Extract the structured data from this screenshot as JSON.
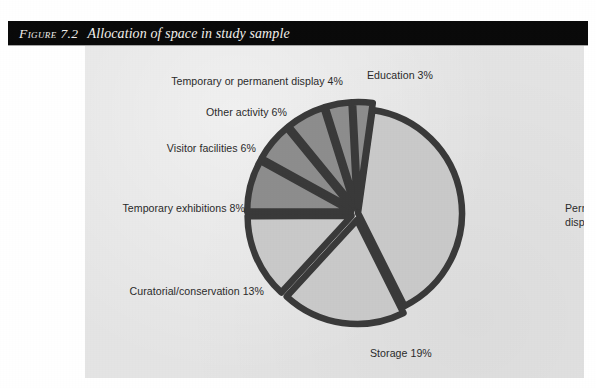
{
  "figure": {
    "number_label": "Figure 7.2",
    "title": "Allocation of space in study sample"
  },
  "colors": {
    "banner_background": "#0a0a0a",
    "banner_text": "#f2f0ec",
    "panel_background": "#e4e4e4",
    "page_background": "#ffffff",
    "slice_major": "#c9c9c9",
    "slice_minor": "#8d8d8d",
    "slice_outline": "#3a3a3a",
    "label_text": "#2b2b2b"
  },
  "chart_data": {
    "type": "pie",
    "title": "Allocation of space in study sample",
    "subtitle": "",
    "xlabel": "",
    "ylabel": "",
    "units": "percent",
    "total": 99,
    "legend_position": "none",
    "grid": false,
    "labels_outside": true,
    "categories": [
      "Permanent displays",
      "Storage",
      "Curatorial/conservation",
      "Temporary exhibitions",
      "Visitor facilities",
      "Other activity",
      "Temporary or permanent display",
      "Education"
    ],
    "values": [
      40,
      19,
      13,
      8,
      6,
      6,
      4,
      3
    ],
    "slices": [
      {
        "category": "Permanent displays",
        "value": 40,
        "label": "Permanent displays 40%",
        "label_lines": [
          "Permanent",
          "displays 40%"
        ],
        "fill": "#c9c9c9",
        "exploded": false,
        "label_x": 480,
        "label_y": 166,
        "label_anchor": "start"
      },
      {
        "category": "Storage",
        "value": 19,
        "label": "Storage 19%",
        "label_lines": [
          "Storage 19%"
        ],
        "fill": "#c9c9c9",
        "exploded": true,
        "label_x": 285,
        "label_y": 311,
        "label_anchor": "start"
      },
      {
        "category": "Curatorial/conservation",
        "value": 13,
        "label": "Curatorial/conservation 13%",
        "label_lines": [
          "Curatorial/conservation 13%"
        ],
        "fill": "#c9c9c9",
        "exploded": true,
        "label_x": 179,
        "label_y": 249,
        "label_anchor": "end"
      },
      {
        "category": "Temporary exhibitions",
        "value": 8,
        "label": "Temporary exhibitions 8%",
        "label_lines": [
          "Temporary exhibitions 8%"
        ],
        "fill": "#8d8d8d",
        "exploded": true,
        "label_x": 160,
        "label_y": 166,
        "label_anchor": "end"
      },
      {
        "category": "Visitor facilities",
        "value": 6,
        "label": "Visitor facilities 6%",
        "label_lines": [
          "Visitor facilities 6%"
        ],
        "fill": "#8d8d8d",
        "exploded": true,
        "label_x": 171,
        "label_y": 106,
        "label_anchor": "end"
      },
      {
        "category": "Other activity",
        "value": 6,
        "label": "Other activity 6%",
        "label_lines": [
          "Other activity 6%"
        ],
        "fill": "#8d8d8d",
        "exploded": true,
        "label_x": 202,
        "label_y": 70,
        "label_anchor": "end"
      },
      {
        "category": "Temporary or permanent display",
        "value": 4,
        "label": "Temporary or permanent display 4%",
        "label_lines": [
          "Temporary or permanent display 4%"
        ],
        "fill": "#8d8d8d",
        "exploded": true,
        "label_x": 258,
        "label_y": 39,
        "label_anchor": "end"
      },
      {
        "category": "Education",
        "value": 3,
        "label": "Education 3%",
        "label_lines": [
          "Education 3%"
        ],
        "fill": "#8d8d8d",
        "exploded": true,
        "label_x": 282,
        "label_y": 33,
        "label_anchor": "start"
      }
    ],
    "geometry": {
      "center_x": 273,
      "center_y": 167,
      "radius": 104,
      "start_angle_deg": -82,
      "direction": "clockwise",
      "explode_offset": 7,
      "outline_width": 6.5
    }
  }
}
